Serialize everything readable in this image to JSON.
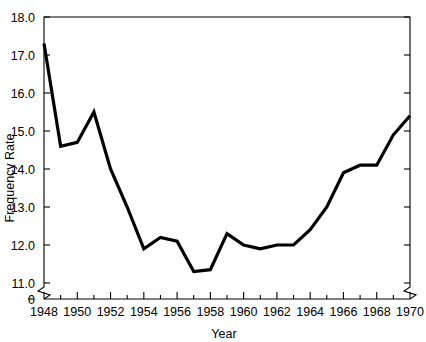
{
  "chart_data": {
    "type": "line",
    "title": "",
    "xlabel": "Year",
    "ylabel": "Frequency Rate",
    "grid": false,
    "legend": false,
    "xlim": [
      1948,
      1970
    ],
    "ylim": [
      11.0,
      18.0
    ],
    "y_axis_break": true,
    "y_axis_break_note": "axis broken between 0 and 11.0",
    "x_axis_break": true,
    "x_axis_break_note": "axis broken at left of 1948 and right of 1970",
    "yticks": [
      "0",
      "11.0",
      "12.0",
      "13.0",
      "14.0",
      "15.0",
      "16.0",
      "17.0",
      "18.0"
    ],
    "ytick_values": [
      0,
      11.0,
      12.0,
      13.0,
      14.0,
      15.0,
      16.0,
      17.0,
      18.0
    ],
    "xticks": [
      "1948",
      "1950",
      "1952",
      "1954",
      "1956",
      "1958",
      "1960",
      "1962",
      "1964",
      "1966",
      "1968",
      "1970"
    ],
    "xtick_values": [
      1948,
      1950,
      1952,
      1954,
      1956,
      1958,
      1960,
      1962,
      1964,
      1966,
      1968,
      1970
    ],
    "x_minor_ticks": [
      1949,
      1951,
      1953,
      1955,
      1957,
      1959,
      1961,
      1963,
      1965,
      1967,
      1969
    ],
    "right_axis_ticks": [
      11.0,
      12.0,
      13.0,
      14.0,
      15.0,
      16.0,
      17.0,
      18.0
    ],
    "series": [
      {
        "name": "Frequency Rate",
        "color": "#000000",
        "x": [
          1948,
          1949,
          1950,
          1951,
          1952,
          1953,
          1954,
          1955,
          1956,
          1957,
          1958,
          1959,
          1960,
          1961,
          1962,
          1963,
          1964,
          1965,
          1966,
          1967,
          1968,
          1969,
          1970
        ],
        "values": [
          17.3,
          14.6,
          14.7,
          15.5,
          14.0,
          13.0,
          11.9,
          12.2,
          12.1,
          11.3,
          11.35,
          12.3,
          12.0,
          11.9,
          12.0,
          12.0,
          12.4,
          13.0,
          13.9,
          14.1,
          14.1,
          14.9,
          15.4
        ]
      }
    ]
  },
  "axis": {
    "y_label": "Frequency Rate",
    "x_label": "Year"
  }
}
